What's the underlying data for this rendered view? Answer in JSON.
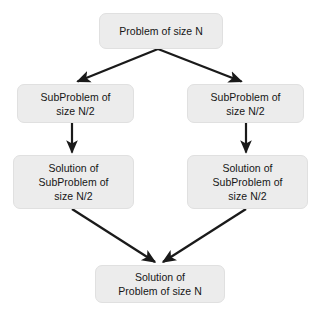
{
  "diagram": {
    "background_color": "#ffffff",
    "node_fill_color": "#ececec",
    "node_border_color": "#e0e0e0",
    "text_color": "#161616",
    "arrow_color": "#1a1a1a",
    "nodes": [
      {
        "id": "root",
        "label": "Problem of size N",
        "role": "original-problem"
      },
      {
        "id": "sub-left",
        "label": "SubProblem of\nsize N/2",
        "role": "left-subproblem"
      },
      {
        "id": "sub-right",
        "label": "SubProblem of\nsize N/2",
        "role": "right-subproblem"
      },
      {
        "id": "sol-left",
        "label": "Solution of\nSubProblem of\nsize N/2",
        "role": "left-subproblem-solution"
      },
      {
        "id": "sol-right",
        "label": "Solution of\nSubProblem of\nsize N/2",
        "role": "right-subproblem-solution"
      },
      {
        "id": "final",
        "label": "Solution of\nProblem of size N",
        "role": "final-solution"
      }
    ],
    "edges": [
      {
        "id": "root-to-sub-left",
        "from": "root",
        "to": "sub-left",
        "kind": "divide"
      },
      {
        "id": "root-to-sub-right",
        "from": "root",
        "to": "sub-right",
        "kind": "divide"
      },
      {
        "id": "sub-left-to-sol-left",
        "from": "sub-left",
        "to": "sol-left",
        "kind": "conquer"
      },
      {
        "id": "sub-right-to-sol-right",
        "from": "sub-right",
        "to": "sol-right",
        "kind": "conquer"
      },
      {
        "id": "sol-left-to-final",
        "from": "sol-left",
        "to": "final",
        "kind": "combine"
      },
      {
        "id": "sol-right-to-final",
        "from": "sol-right",
        "to": "final",
        "kind": "combine"
      }
    ]
  }
}
